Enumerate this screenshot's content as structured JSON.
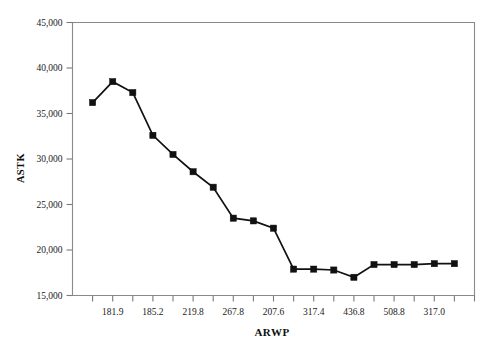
{
  "chart_data": {
    "type": "line",
    "title": "",
    "xlabel": "ARWP",
    "ylabel": "ASTK",
    "ylim": [
      15000,
      45000
    ],
    "yticks": [
      15000,
      20000,
      25000,
      30000,
      35000,
      40000,
      45000
    ],
    "ytick_labels": [
      "15,000",
      "20,000",
      "25,000",
      "30,000",
      "35,000",
      "40,000",
      "45,000"
    ],
    "xtick_labels": [
      "181.9",
      "185.2",
      "219.8",
      "267.8",
      "207.6",
      "317.4",
      "436.8",
      "508.8",
      "317.0"
    ],
    "grid": false,
    "legend": "none",
    "marker": "square",
    "line_color": "#111111",
    "marker_color": "#111111",
    "n_points": 19,
    "x": [
      1,
      2,
      3,
      4,
      5,
      6,
      7,
      8,
      9,
      10,
      11,
      12,
      13,
      14,
      15,
      16,
      17,
      18,
      19
    ],
    "values": [
      36200,
      38500,
      37300,
      32600,
      30500,
      28600,
      26900,
      23500,
      23200,
      22400,
      17900,
      17900,
      17800,
      17000,
      18400,
      18400,
      18400,
      18500,
      18500
    ]
  }
}
